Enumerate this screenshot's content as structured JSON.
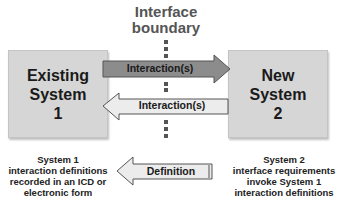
{
  "title": {
    "line1": "Interface",
    "line2": "boundary"
  },
  "left_box": {
    "line1": "Existing",
    "line2": "System",
    "line3": "1"
  },
  "right_box": {
    "line1": "New",
    "line2": "System",
    "line3": "2"
  },
  "arrows": {
    "top": {
      "label": "Interaction(s)",
      "direction": "right",
      "fill": "#8c8c8c"
    },
    "middle": {
      "label": "Interaction(s)",
      "direction": "left",
      "fill": "#e8e8e8"
    },
    "definition": {
      "label": "Definition",
      "direction": "left",
      "fill": "#e8e8e8"
    }
  },
  "captions": {
    "left": [
      "System 1",
      "interaction definitions",
      "recorded in an ICD or",
      "electronic form"
    ],
    "right": [
      "System 2",
      "interface requirements",
      "invoke System 1",
      "interaction definitions"
    ]
  }
}
